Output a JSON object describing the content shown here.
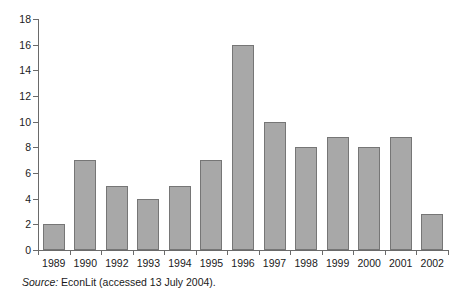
{
  "chart_data": {
    "type": "bar",
    "title": "",
    "subtitle": "",
    "xlabel": "",
    "ylabel": "",
    "categories": [
      "1989",
      "1990",
      "1992",
      "1993",
      "1994",
      "1995",
      "1996",
      "1997",
      "1998",
      "1999",
      "2000",
      "2001",
      "2002"
    ],
    "values": [
      2,
      7,
      5,
      4,
      5,
      7,
      16,
      10,
      8,
      8.8,
      8,
      8.8,
      2.8
    ],
    "series": [
      {
        "name": "Articles",
        "values": [
          2,
          7,
          5,
          4,
          5,
          7,
          16,
          10,
          8,
          8.8,
          8,
          8.8,
          2.8
        ]
      }
    ],
    "ylim": [
      0,
      18
    ],
    "ytick_step": 2,
    "yticks": [
      "18",
      "16",
      "14",
      "12",
      "10",
      "8",
      "6",
      "4",
      "2",
      "0"
    ],
    "ytick_values": [
      18,
      16,
      14,
      12,
      10,
      8,
      6,
      4,
      2,
      0
    ],
    "grid": false,
    "legend": false,
    "legend_position": "none",
    "bar_color": "#a8a8a8",
    "bar_border_color": "#767676",
    "axis_color": "#6a6a6a"
  },
  "source": {
    "label": "Source:",
    "text": "EconLit (accessed 13 July 2004)."
  }
}
